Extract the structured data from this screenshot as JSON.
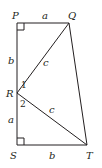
{
  "diagram": {
    "type": "geometry",
    "vertices": {
      "P": {
        "label": "P",
        "x": 17,
        "y": 23
      },
      "Q": {
        "label": "Q",
        "x": 69,
        "y": 23
      },
      "R": {
        "label": "R",
        "x": 17,
        "y": 93
      },
      "S": {
        "label": "S",
        "x": 17,
        "y": 145
      },
      "T": {
        "label": "T",
        "x": 87,
        "y": 145
      }
    },
    "segment_labels": {
      "PQ": "a",
      "PR": "b",
      "RQ": "c",
      "RS": "a",
      "RT": "c",
      "ST": "b"
    },
    "angle_labels": {
      "angle1": "1",
      "angle2": "2"
    },
    "right_angles": [
      "P",
      "S"
    ],
    "stroke_color": "#231f20"
  }
}
